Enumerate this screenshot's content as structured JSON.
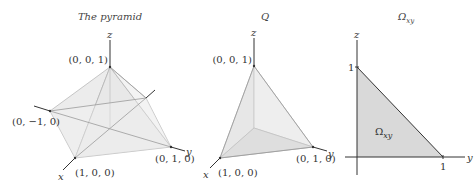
{
  "panels": {
    "pyramid": {
      "title": "The pyramid",
      "axis_labels": {
        "x": "x",
        "y": "y",
        "z": "z"
      },
      "vertices": {
        "top": "(0, 0, 1)",
        "left": "(0, −1, 0)",
        "front": "(1, 0, 0)",
        "right": "(0, 1, 0)"
      }
    },
    "q": {
      "title": "Q",
      "axis_labels": {
        "x": "x",
        "y": "y",
        "z": "z"
      },
      "vertices": {
        "top": "(0, 0, 1)",
        "front": "(1, 0, 0)",
        "right": "(0, 1, 0)"
      }
    },
    "omega": {
      "title_main": "Ω",
      "title_sub": "xy",
      "axis_labels": {
        "vertical": "z",
        "horizontal": "y"
      },
      "ticks": {
        "vertical": "1",
        "horizontal": "1"
      },
      "region_label_main": "Ω",
      "region_label_sub": "xy"
    }
  },
  "colors": {
    "face_light": "#ececec",
    "face_mid": "#e0e0e0",
    "face_dark": "#cfcfcf",
    "region_fill": "#d9d9d9",
    "axis": "#333333"
  }
}
